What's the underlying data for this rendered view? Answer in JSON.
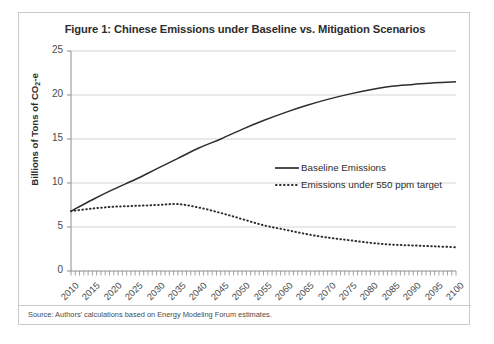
{
  "figure": {
    "title": "Figure 1: Chinese Emissions under Baseline vs. Mitigation Scenarios",
    "source_note": "Source: Authors' calculations based on Energy Modeling Forum estimates.",
    "y_axis_title_main": "Billions of Tons of CO",
    "y_axis_title_sub": "2",
    "y_axis_title_tail": "-e"
  },
  "legend": {
    "position": "inside-right",
    "entries": [
      {
        "label": "Baseline Emissions",
        "style": "solid",
        "color": "#2d2d2d"
      },
      {
        "label": "Emissions under 550 ppm target",
        "style": "dotted",
        "color": "#2d2d2d"
      }
    ]
  },
  "chart_data": {
    "type": "line",
    "title": "Figure 1: Chinese Emissions under Baseline vs. Mitigation Scenarios",
    "xlabel": "",
    "ylabel": "Billions of Tons of CO2-e",
    "xlim": [
      2010,
      2100
    ],
    "ylim": [
      0,
      25
    ],
    "grid": true,
    "y_ticks": [
      0,
      5,
      10,
      15,
      20,
      25
    ],
    "x_ticks": [
      2010,
      2015,
      2020,
      2025,
      2030,
      2035,
      2040,
      2045,
      2050,
      2055,
      2060,
      2065,
      2070,
      2075,
      2080,
      2085,
      2090,
      2095,
      2100
    ],
    "x": [
      2010,
      2015,
      2020,
      2025,
      2030,
      2035,
      2040,
      2045,
      2050,
      2055,
      2060,
      2065,
      2070,
      2075,
      2080,
      2085,
      2090,
      2095,
      2100
    ],
    "series": [
      {
        "name": "Baseline Emissions",
        "style": "solid",
        "values": [
          6.8,
          8.1,
          9.3,
          10.4,
          11.6,
          12.8,
          14.0,
          15.0,
          16.1,
          17.1,
          18.0,
          18.8,
          19.5,
          20.1,
          20.6,
          21.0,
          21.2,
          21.4,
          21.5
        ]
      },
      {
        "name": "Emissions under 550 ppm target",
        "style": "dotted",
        "values": [
          6.8,
          7.1,
          7.3,
          7.4,
          7.5,
          7.6,
          7.2,
          6.6,
          5.9,
          5.2,
          4.7,
          4.2,
          3.8,
          3.5,
          3.2,
          3.0,
          2.9,
          2.8,
          2.7
        ]
      }
    ]
  }
}
